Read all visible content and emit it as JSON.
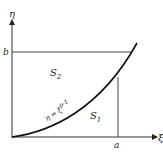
{
  "diagram": {
    "axes": {
      "x_label": "ξ",
      "y_label": "η"
    },
    "ticks": {
      "x_tick": "a",
      "y_tick": "b"
    },
    "regions": {
      "s1": "S",
      "s1_sub": "1",
      "s2": "S",
      "s2_sub": "2"
    },
    "curve_label": {
      "lhs": "η = ξ",
      "exp": "p-1"
    },
    "colors": {
      "line": "#222222",
      "curve": "#111111"
    }
  }
}
